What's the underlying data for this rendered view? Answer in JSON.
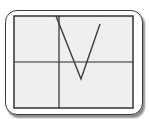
{
  "colors": {
    "frame_border": "#3a3a3a",
    "screen_bg": "#efefef",
    "screen_border": "#333333",
    "axis": "#2a2a2a",
    "curve": "#3c3c3c"
  },
  "screen": {
    "x": 14,
    "y": 16,
    "width": 119,
    "height": 92
  },
  "chart_data": {
    "type": "line",
    "title": "",
    "xlabel": "",
    "ylabel": "",
    "grid": false,
    "axes_visible": true,
    "function_form": "y = a|x - h| + k, a > 0, h > 0, k < 0",
    "pixel_geometry": {
      "y_axis_x": 59,
      "x_axis_y": 62,
      "left_arm_start": [
        56,
        16
      ],
      "vertex": [
        81,
        79
      ],
      "right_arm_end": [
        100,
        24
      ]
    },
    "series": [
      {
        "name": "absolute value curve",
        "points_px": [
          [
            56,
            16
          ],
          [
            81,
            79
          ],
          [
            100,
            24
          ]
        ]
      }
    ]
  }
}
